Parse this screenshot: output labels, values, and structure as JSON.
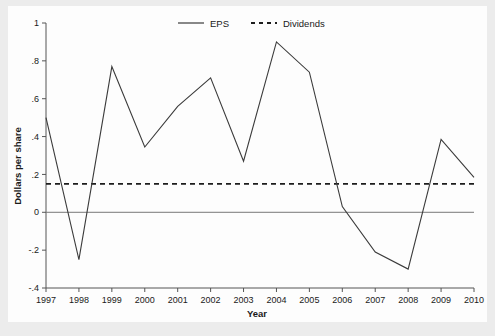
{
  "chart_data": {
    "type": "line",
    "title": "",
    "xlabel": "Year",
    "ylabel": "Dollars per share",
    "categories": [
      "1997",
      "1998",
      "1999",
      "2000",
      "2001",
      "2002",
      "2003",
      "2004",
      "2005",
      "2006",
      "2007",
      "2008",
      "2009",
      "2010"
    ],
    "x": [
      1997,
      1998,
      1999,
      2000,
      2001,
      2002,
      2003,
      2004,
      2005,
      2006,
      2007,
      2008,
      2009,
      2010
    ],
    "series": [
      {
        "name": "EPS",
        "style": "solid",
        "color": "#3b3b3b",
        "values": [
          0.5,
          -0.25,
          0.77,
          0.345,
          0.56,
          0.71,
          0.27,
          0.9,
          0.74,
          0.03,
          -0.21,
          -0.3,
          0.385,
          0.185
        ]
      },
      {
        "name": "Dividends",
        "style": "dashed",
        "color": "#1d1d1d",
        "values": [
          0.15,
          0.15,
          0.15,
          0.15,
          0.15,
          0.15,
          0.15,
          0.15,
          0.15,
          0.15,
          0.15,
          0.15,
          0.15,
          0.15
        ]
      }
    ],
    "ylim": [
      -0.4,
      1.0
    ],
    "xlim": [
      1997,
      2010
    ],
    "yticks": [
      1,
      0.8,
      0.6,
      0.4,
      0.2,
      0,
      -0.2,
      -0.4
    ],
    "ytick_labels": [
      "1",
      ".8",
      ".6",
      ".4",
      ".2",
      "0",
      "-.2",
      "-.4"
    ],
    "xticks": [
      1997,
      1998,
      1999,
      2000,
      2001,
      2002,
      2003,
      2004,
      2005,
      2006,
      2007,
      2008,
      2009,
      2010
    ],
    "xtick_labels": [
      "1997",
      "1998",
      "1999",
      "2000",
      "2001",
      "2002",
      "2003",
      "2004",
      "2005",
      "2006",
      "2007",
      "2008",
      "2009",
      "2010"
    ],
    "grid": false,
    "zero_line": true,
    "legend_position": "top-center",
    "legend": [
      "EPS",
      "Dividends"
    ]
  },
  "axes": {
    "y_title": "Dollars per share",
    "x_title": "Year"
  },
  "legend": {
    "eps_label": "EPS",
    "dividends_label": "Dividends"
  }
}
